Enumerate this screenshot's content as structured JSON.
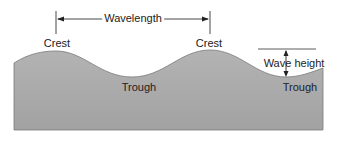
{
  "diagram": {
    "labels": {
      "wavelength": "Wavelength",
      "crest_left": "Crest",
      "crest_right": "Crest",
      "trough_left": "Trough",
      "trough_right": "Trough",
      "wave_height": "Wave height"
    },
    "colors": {
      "water_fill": "#a9a9a9",
      "water_fill_light": "#bdbdbd",
      "line": "#333333",
      "text": "#222222",
      "background": "#ffffff"
    }
  }
}
